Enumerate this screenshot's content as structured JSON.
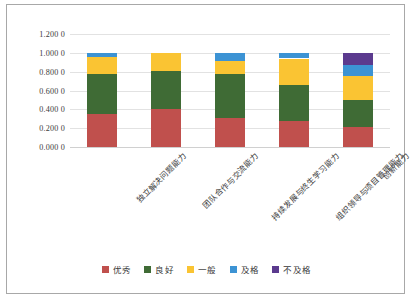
{
  "chart_data": {
    "type": "bar",
    "subtype": "stacked-100",
    "title": "",
    "xlabel": "",
    "ylabel": "",
    "ylim": [
      0.0,
      1.2
    ],
    "grid": true,
    "legend_position": "bottom",
    "ytick_labels": [
      "1.200 0",
      "1.000 0",
      "0.800 0",
      "0.600 0",
      "0.400 0",
      "0.200 0",
      "0.000 0"
    ],
    "ytick_values": [
      1.2,
      1.0,
      0.8,
      0.6,
      0.4,
      0.2,
      0.0
    ],
    "categories": [
      "独立解决问题能力",
      "团队合作与交流能力",
      "持续发展与终生学习能力",
      "组织领导与项目管理能力",
      "创新能力"
    ],
    "series": [
      {
        "name": "优秀",
        "color": "#C0504D",
        "values": [
          0.35,
          0.405,
          0.31,
          0.275,
          0.215
        ]
      },
      {
        "name": "良好",
        "color": "#3F6B35",
        "values": [
          0.425,
          0.405,
          0.465,
          0.38,
          0.285
        ]
      },
      {
        "name": "一般",
        "color": "#FAC433",
        "values": [
          0.18,
          0.19,
          0.14,
          0.285,
          0.25
        ]
      },
      {
        "name": "及格",
        "color": "#3C93D4",
        "values": [
          0.045,
          0.0,
          0.085,
          0.06,
          0.125
        ]
      },
      {
        "name": "不及格",
        "color": "#5B3A8E",
        "values": [
          0.0,
          0.0,
          0.0,
          0.0,
          0.125
        ]
      }
    ]
  },
  "legend": {
    "items": [
      {
        "label": "优秀",
        "color": "#C0504D"
      },
      {
        "label": "良好",
        "color": "#3F6B35"
      },
      {
        "label": "一般",
        "color": "#FAC433"
      },
      {
        "label": "及格",
        "color": "#3C93D4"
      },
      {
        "label": "不及格",
        "color": "#5B3A8E"
      }
    ]
  },
  "style": {
    "frame_border": "#a8a8a8",
    "gridline": "#e2e2e2",
    "background": "#ffffff",
    "text": "#3a3a3a"
  }
}
